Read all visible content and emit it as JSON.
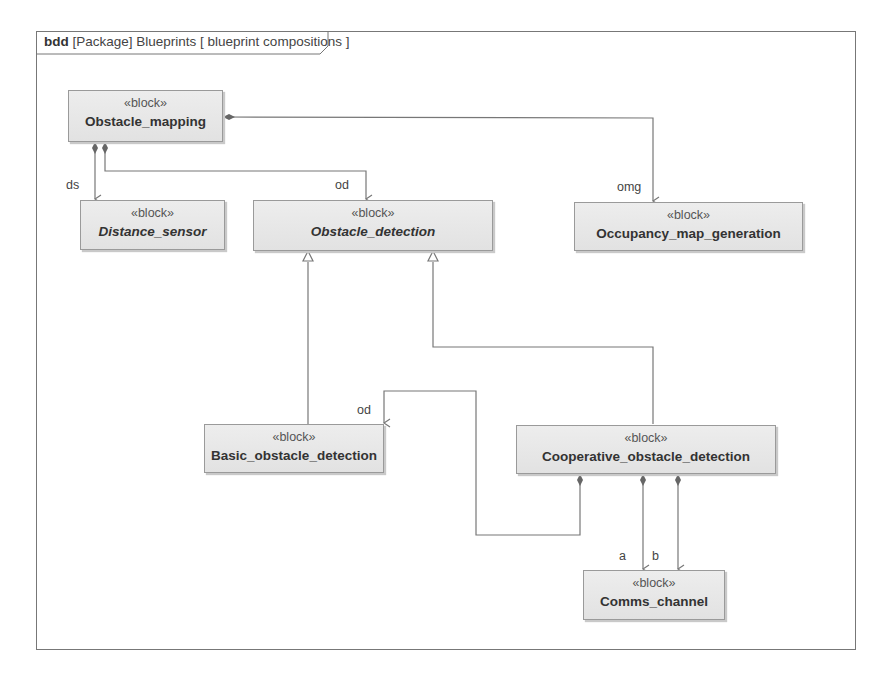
{
  "frame": {
    "kind": "bdd",
    "title": "[Package] Blueprints [ blueprint compositions ]"
  },
  "blocks": [
    {
      "id": "obstacle_mapping",
      "stereotype": "«block»",
      "name": "Obstacle_mapping",
      "abstract": false
    },
    {
      "id": "distance_sensor",
      "stereotype": "«block»",
      "name": "Distance_sensor",
      "abstract": true
    },
    {
      "id": "obstacle_detection",
      "stereotype": "«block»",
      "name": "Obstacle_detection",
      "abstract": true
    },
    {
      "id": "occupancy_map_generation",
      "stereotype": "«block»",
      "name": "Occupancy_map_generation",
      "abstract": false
    },
    {
      "id": "basic_obstacle_detection",
      "stereotype": "«block»",
      "name": "Basic_obstacle_detection",
      "abstract": false
    },
    {
      "id": "cooperative_obstacle_detection",
      "stereotype": "«block»",
      "name": "Cooperative_obstacle_detection",
      "abstract": false
    },
    {
      "id": "comms_channel",
      "stereotype": "«block»",
      "name": "Comms_channel",
      "abstract": false
    }
  ],
  "relations": [
    {
      "type": "composition",
      "from": "Obstacle_mapping",
      "to": "Distance_sensor",
      "role": "ds"
    },
    {
      "type": "composition",
      "from": "Obstacle_mapping",
      "to": "Obstacle_detection",
      "role": "od"
    },
    {
      "type": "composition",
      "from": "Obstacle_mapping",
      "to": "Occupancy_map_generation",
      "role": "omg"
    },
    {
      "type": "generalization",
      "from": "Basic_obstacle_detection",
      "to": "Obstacle_detection"
    },
    {
      "type": "generalization",
      "from": "Cooperative_obstacle_detection",
      "to": "Obstacle_detection"
    },
    {
      "type": "composition",
      "from": "Cooperative_obstacle_detection",
      "to": "Basic_obstacle_detection",
      "role": "od"
    },
    {
      "type": "composition",
      "from": "Cooperative_obstacle_detection",
      "to": "Comms_channel",
      "role": "a"
    },
    {
      "type": "composition",
      "from": "Cooperative_obstacle_detection",
      "to": "Comms_channel",
      "role": "b"
    }
  ],
  "roles": {
    "ds": "ds",
    "od_top": "od",
    "omg": "omg",
    "od_basic": "od",
    "a": "a",
    "b": "b"
  },
  "colors": {
    "block_fill": "#e6e6e6",
    "block_border": "#9a9a9a",
    "line": "#777777"
  }
}
